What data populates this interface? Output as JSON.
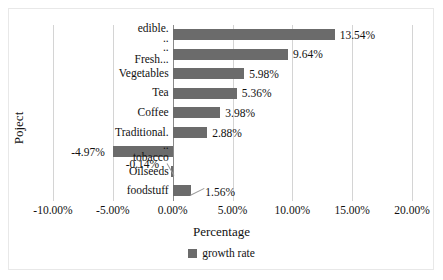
{
  "chart_data": {
    "type": "bar",
    "orientation": "horizontal",
    "title": "",
    "xlabel": "Percentage",
    "ylabel": "Poject",
    "xlim": [
      -10,
      20
    ],
    "xticks": [
      "-10.00%",
      "-5.00%",
      "0.00%",
      "5.00%",
      "10.00%",
      "15.00%",
      "20.00%"
    ],
    "xtick_values": [
      -10,
      -5,
      0,
      5,
      10,
      15,
      20
    ],
    "grid": true,
    "legend": {
      "position": "bottom",
      "entries": [
        "growth rate"
      ]
    },
    "series": [
      {
        "name": "growth rate",
        "color": "#6b6b6b",
        "categories": [
          "edible..",
          "Fresh...",
          "Vegetables",
          "Tea",
          "Coffee",
          "Traditional...",
          "tobacco",
          "Oilseeds",
          "foodstuff"
        ],
        "values": [
          13.54,
          9.64,
          5.98,
          5.36,
          3.98,
          2.88,
          -4.97,
          -0.14,
          1.56
        ],
        "data_labels": [
          "13.54%",
          "9.64%",
          "5.98%",
          "5.36%",
          "3.98%",
          "2.88%",
          "-4.97%",
          "-0.14%",
          "1.56%"
        ]
      }
    ],
    "category_label_lines": [
      [
        "edible.",
        ".."
      ],
      [
        "..",
        "Fresh..."
      ],
      [
        "Vegetables"
      ],
      [
        "Tea"
      ],
      [
        "Coffee"
      ],
      [
        "Traditional."
      ],
      [
        "..",
        "tobacco"
      ],
      [
        "Oilseeds"
      ],
      [
        "foodstuff"
      ]
    ]
  },
  "axis": {
    "x_title": "Percentage",
    "y_title": "Poject"
  },
  "legend": {
    "swatch_name": "growth-rate-swatch",
    "label": "growth rate"
  }
}
